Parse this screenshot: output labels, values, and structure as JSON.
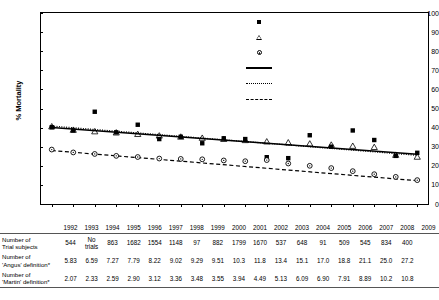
{
  "chart_data": {
    "type": "scatter",
    "title": "",
    "xlabel": "Year",
    "ylabel": "% Mortality",
    "ylim": [
      0,
      100
    ],
    "ytick_labels": [
      "0",
      "10",
      "20",
      "30",
      "40",
      "50",
      "60",
      "70",
      "80",
      "90",
      "100"
    ],
    "grid": false,
    "legend_position": "top-right",
    "x": [
      1992,
      1993,
      1994,
      1995,
      1996,
      1997,
      1998,
      1999,
      2000,
      2001,
      2002,
      2003,
      2004,
      2005,
      2006,
      2007,
      2008,
      2009
    ],
    "xtick_labels": [
      "1992",
      "1993",
      "1994",
      "1995",
      "1996",
      "1997",
      "1998",
      "1999",
      "2000",
      "2001",
      "2002",
      "2003",
      "2004",
      "2005",
      "2006",
      "2007",
      "2008",
      "2009"
    ],
    "series": [
      {
        "name": "Multicenter Trials",
        "marker": "filled-square",
        "values": [
          40.2,
          38.5,
          48.3,
          37.5,
          41.5,
          34.0,
          35.2,
          31.8,
          34.4,
          34.0,
          24.5,
          24.0,
          36.0,
          30.0,
          38.5,
          33.5,
          25.2,
          26.8
        ]
      },
      {
        "name": "Martin criteria",
        "marker": "open-triangle",
        "values": [
          40.4,
          38.6,
          37.8,
          37.2,
          36.4,
          35.6,
          35.0,
          34.4,
          33.8,
          33.2,
          32.5,
          32.0,
          31.4,
          30.8,
          30.2,
          29.6,
          25.5,
          24.5
        ]
      },
      {
        "name": "Angus criteria",
        "marker": "open-circle-dot",
        "values": [
          28.5,
          27.0,
          26.2,
          25.2,
          24.6,
          23.8,
          23.6,
          23.4,
          22.8,
          22.4,
          23.0,
          21.2,
          20.0,
          18.8,
          17.2,
          15.6,
          14.2,
          12.5
        ]
      }
    ],
    "regression_lines": [
      {
        "name": "Multicenter trials regression line",
        "style": "solid",
        "y_start": 40.0,
        "y_end": 26.0
      },
      {
        "name": "Martin regression line",
        "style": "dotted",
        "y_start": 40.8,
        "y_end": 25.5
      },
      {
        "name": "Angus regression line",
        "style": "dashed",
        "y_start": 28.0,
        "y_end": 12.2
      }
    ]
  },
  "legend": {
    "items": [
      {
        "label": "Multicenter Trials",
        "mark": "filled-square"
      },
      {
        "label": "Martin criteria",
        "mark": "open-triangle"
      },
      {
        "label": "Angus criteria",
        "mark": "open-circle-dot"
      },
      {
        "label": "Multicenter trials regression line",
        "mark": "solid-line"
      },
      {
        "label": "Martin regression line",
        "mark": "dotted-line"
      },
      {
        "label": "Angus regression line",
        "mark": "dashed-line"
      }
    ]
  },
  "table": {
    "columns": [
      "1992",
      "1993",
      "1994",
      "1995",
      "1996",
      "1997",
      "1998",
      "1999",
      "2000",
      "2001",
      "2002",
      "2003",
      "2004",
      "2005",
      "2006",
      "2007",
      "2008",
      "2009"
    ],
    "corner": "",
    "rows": [
      {
        "label": "Number of\nTrial subjects",
        "label_line1": "Number of",
        "label_line2": "Trial subjects",
        "values": [
          "544",
          "No\ntrials",
          "863",
          "1682",
          "1554",
          "1148",
          "97",
          "882",
          "1799",
          "1670",
          "537",
          "648",
          "91",
          "509",
          "545",
          "834",
          "400"
        ],
        "values_display": [
          "544",
          "No trials",
          "863",
          "1682",
          "1554",
          "1148",
          "97",
          "882",
          "1799",
          "1670",
          "537",
          "648",
          "91",
          "509",
          "545",
          "834",
          "400"
        ]
      },
      {
        "label_line1": "Number of",
        "label_line2": "'Angus' definition*",
        "values_display": [
          "5.83",
          "6.59",
          "7.27",
          "7.79",
          "8.22",
          "9.02",
          "9.29",
          "9.51",
          "10.3",
          "11.8",
          "13.4",
          "15.1",
          "17.0",
          "18.8",
          "21.1",
          "25.0",
          "27.2"
        ]
      },
      {
        "label_line1": "Number of",
        "label_line2": "'Martin' definition*",
        "values_display": [
          "2.07",
          "2.33",
          "2.59",
          "2.90",
          "3.12",
          "3.36",
          "3.48",
          "3.55",
          "3.94",
          "4.49",
          "5.13",
          "6.09",
          "6.90",
          "7.91",
          "8.89",
          "10.2",
          "10.8"
        ]
      }
    ]
  },
  "colors": {
    "ink": "#000000",
    "rule": "#555555",
    "background": "#ffffff"
  }
}
